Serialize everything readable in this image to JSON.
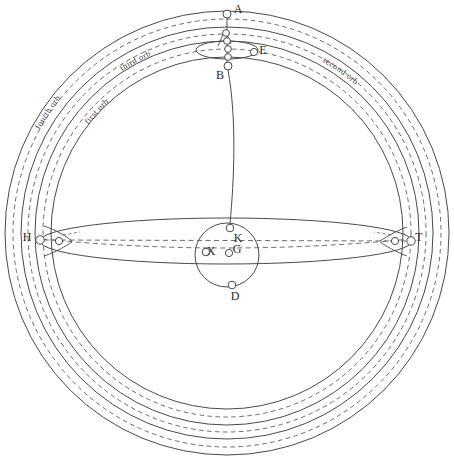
{
  "figure": {
    "background": "#ffffff",
    "stroke_color": "#4a4a4a",
    "dash_color": "#5a5a5a",
    "text_color": "#2b2b2b",
    "width": 454,
    "height": 469
  },
  "center": {
    "x": 227,
    "y": 233
  },
  "chart_data": {
    "type": "diagram",
    "center": {
      "x": 227,
      "y": 233
    },
    "solid_circles": [
      {
        "name": "fourth-orb-outer",
        "r": 222
      },
      {
        "name": "fourth-orb-inner",
        "r": 206
      },
      {
        "name": "third-orb-inner",
        "r": 192
      },
      {
        "name": "first-orb-inner",
        "r": 176
      }
    ],
    "dashed_circles": [
      {
        "name": "dashed-outer",
        "r": 214
      },
      {
        "name": "dashed-middle",
        "r": 199
      },
      {
        "name": "dashed-inner",
        "r": 184
      }
    ],
    "arc_labels": [
      {
        "id": "fourth-orb",
        "text": "fourth orb",
        "r": 214,
        "angle_deg": 214
      },
      {
        "id": "third-orb",
        "text": "third orb",
        "r": 193,
        "angle_deg": 242
      },
      {
        "id": "first-orb",
        "text": "first orb",
        "r": 176,
        "angle_deg": 223
      },
      {
        "id": "second-orb",
        "text": "second orb",
        "r": 196,
        "angle_deg": 305
      }
    ],
    "points": [
      {
        "id": "A",
        "label": "A",
        "x": 227,
        "y": 14,
        "lx": 238,
        "ly": 10,
        "r": 4.0
      },
      {
        "id": "E",
        "label": "E",
        "x": 254,
        "y": 52,
        "lx": 263,
        "ly": 51,
        "r": 3.6
      },
      {
        "id": "B",
        "label": "B",
        "x": 228,
        "y": 66,
        "lx": 220,
        "ly": 76,
        "r": 4.0
      },
      {
        "id": "K",
        "label": "K",
        "x": 230,
        "y": 228,
        "lx": 238,
        "ly": 239,
        "r": 3.8
      },
      {
        "id": "X",
        "label": "X",
        "x": 206,
        "y": 252,
        "lx": 211,
        "ly": 252,
        "r": 3.8
      },
      {
        "id": "G",
        "label": "G",
        "x": 229,
        "y": 253,
        "lx": 237,
        "ly": 250,
        "r": 3.6
      },
      {
        "id": "D",
        "label": "D",
        "x": 232,
        "y": 285,
        "lx": 235,
        "ly": 297,
        "r": 3.8
      },
      {
        "id": "H",
        "label": "H",
        "x": 40,
        "y": 240,
        "lx": 27,
        "ly": 238,
        "r": 4.2
      },
      {
        "id": "T",
        "label": "T",
        "x": 411,
        "y": 241,
        "lx": 419,
        "ly": 238,
        "r": 4.2
      }
    ],
    "unlabeled_nodes": [
      {
        "id": "chain-1",
        "x": 226,
        "y": 33,
        "r": 3.4
      },
      {
        "id": "chain-2",
        "x": 227,
        "y": 41,
        "r": 3.4
      },
      {
        "id": "chain-3",
        "x": 228,
        "y": 49,
        "r": 3.4
      },
      {
        "id": "chain-4",
        "x": 228,
        "y": 57,
        "r": 3.4
      },
      {
        "id": "node-near-h",
        "x": 59,
        "y": 241,
        "r": 3.6
      },
      {
        "id": "node-near-t",
        "x": 395,
        "y": 241,
        "r": 3.6
      }
    ],
    "center_circle": {
      "cx": 227,
      "cy": 255,
      "r": 32
    },
    "small_ellipse": {
      "cx": 227,
      "cy": 50,
      "rx": 31,
      "ry": 9
    },
    "equator_ellipse": {
      "cx": 226,
      "cy": 241,
      "rx": 186,
      "ry": 23
    },
    "meridian_line": {
      "from": "B",
      "to": "K",
      "description": "curved line from B to K"
    }
  },
  "labels": {
    "A": "A",
    "B": "B",
    "E": "E",
    "K": "K",
    "X": "X",
    "G": "G",
    "D": "D",
    "H": "H",
    "T": "T",
    "fourth_orb": "fourth orb",
    "third_orb": "third orb",
    "first_orb": "first orb",
    "second_orb": "second orb"
  }
}
